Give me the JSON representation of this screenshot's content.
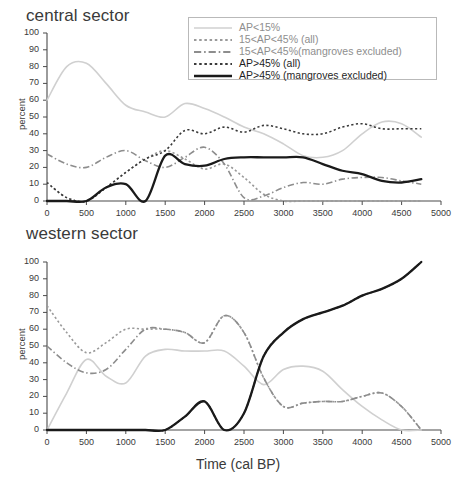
{
  "figure": {
    "xlabel": "Time (cal BP)",
    "panels": [
      {
        "title": "central sector",
        "ylabel": "percent"
      },
      {
        "title": "western sector",
        "ylabel": "percent"
      }
    ]
  },
  "legend": {
    "entries": [
      {
        "label": "AP<15%",
        "style": "solid",
        "color": "#d0d0d0",
        "width": 1.6
      },
      {
        "label": "15<AP<45% (all)",
        "style": "dotted",
        "color": "#9a9a9a",
        "width": 1.6
      },
      {
        "label": "15<AP<45%(mangroves excluded)",
        "style": "dashdot",
        "color": "#8d8d8d",
        "width": 1.6
      },
      {
        "label": "AP>45% (all)",
        "style": "dotted",
        "color": "#3a3a3a",
        "width": 1.6
      },
      {
        "label": "AP>45% (mangroves excluded)",
        "style": "solid",
        "color": "#1a1a1a",
        "width": 2.4
      }
    ]
  },
  "axes": {
    "y_ticks": [
      0,
      10,
      20,
      30,
      40,
      50,
      60,
      70,
      80,
      90,
      100
    ],
    "x_ticks": [
      0,
      500,
      1000,
      1500,
      2000,
      2500,
      3000,
      3500,
      4000,
      4500,
      5000
    ],
    "ylim": [
      0,
      100
    ],
    "xlim": [
      0,
      5000
    ]
  },
  "chart_data": [
    {
      "type": "line",
      "title": "central sector",
      "xlabel": "",
      "ylabel": "percent",
      "xlim": [
        0,
        5000
      ],
      "ylim": [
        0,
        100
      ],
      "grid": false,
      "legend_position": "top-right",
      "x": [
        0,
        250,
        500,
        750,
        1000,
        1250,
        1500,
        1750,
        2000,
        2250,
        2500,
        2750,
        3000,
        3250,
        3500,
        3750,
        4000,
        4250,
        4500,
        4750
      ],
      "series": [
        {
          "name": "AP<15%",
          "style": "solid",
          "color": "#d0d0d0",
          "values": [
            60,
            80,
            82,
            70,
            57,
            53,
            50,
            58,
            55,
            50,
            44,
            40,
            34,
            27,
            26,
            30,
            40,
            47,
            46,
            38
          ]
        },
        {
          "name": "15<AP<45% (all)",
          "style": "dotted",
          "color": "#9a9a9a",
          "values": [
            11,
            2,
            0,
            8,
            17,
            25,
            30,
            25,
            19,
            22,
            14,
            4,
            0,
            0,
            0,
            0,
            0,
            0,
            0,
            0
          ]
        },
        {
          "name": "15<AP<45%(mangroves excluded)",
          "style": "dashdot",
          "color": "#8d8d8d",
          "values": [
            28,
            22,
            20,
            26,
            30,
            24,
            20,
            26,
            32,
            22,
            2,
            3,
            8,
            11,
            10,
            13,
            14,
            14,
            12,
            10
          ]
        },
        {
          "name": "AP>45% (all)",
          "style": "dotted",
          "color": "#3a3a3a",
          "values": [
            11,
            2,
            0,
            8,
            17,
            25,
            30,
            42,
            40,
            44,
            41,
            45,
            43,
            40,
            40,
            44,
            46,
            43,
            43,
            43
          ]
        },
        {
          "name": "AP>45% (mangroves excluded)",
          "style": "solid",
          "color": "#1a1a1a",
          "values": [
            0,
            0,
            0,
            8,
            10,
            0,
            27,
            22,
            21,
            25,
            26,
            26,
            26,
            26,
            22,
            18,
            16,
            12,
            11,
            13
          ]
        }
      ]
    },
    {
      "type": "line",
      "title": "western sector",
      "xlabel": "Time (cal BP)",
      "ylabel": "percent",
      "xlim": [
        0,
        5000
      ],
      "ylim": [
        0,
        100
      ],
      "grid": false,
      "legend_position": "none",
      "x": [
        0,
        250,
        500,
        750,
        1000,
        1250,
        1500,
        1750,
        2000,
        2250,
        2500,
        2750,
        3000,
        3250,
        3500,
        3750,
        4000,
        4250,
        4500,
        4750
      ],
      "series": [
        {
          "name": "AP<15%",
          "style": "solid",
          "color": "#d0d0d0",
          "values": [
            0,
            22,
            42,
            32,
            28,
            44,
            48,
            47,
            47,
            47,
            38,
            27,
            36,
            38,
            35,
            24,
            14,
            6,
            0,
            0
          ]
        },
        {
          "name": "15<AP<45% (all)",
          "style": "dotted",
          "color": "#9a9a9a",
          "values": [
            74,
            58,
            46,
            52,
            60,
            60,
            60,
            58,
            52,
            68,
            58,
            31,
            14,
            16,
            17,
            17,
            20,
            22,
            14,
            0
          ]
        },
        {
          "name": "15<AP<45%(mangroves excluded)",
          "style": "dashdot",
          "color": "#8d8d8d",
          "values": [
            50,
            40,
            34,
            36,
            48,
            60,
            60,
            58,
            52,
            68,
            58,
            31,
            14,
            16,
            17,
            17,
            20,
            22,
            14,
            0
          ]
        },
        {
          "name": "AP>45% (all)",
          "style": "dotted",
          "color": "#3a3a3a",
          "values": [
            0,
            0,
            0,
            0,
            0,
            0,
            0,
            8,
            17,
            0,
            10,
            44,
            58,
            66,
            70,
            74,
            80,
            84,
            90,
            100
          ]
        },
        {
          "name": "AP>45% (mangroves excluded)",
          "style": "solid",
          "color": "#1a1a1a",
          "values": [
            0,
            0,
            0,
            0,
            0,
            0,
            0,
            8,
            17,
            0,
            10,
            44,
            58,
            66,
            70,
            74,
            80,
            84,
            90,
            100
          ]
        }
      ]
    }
  ]
}
